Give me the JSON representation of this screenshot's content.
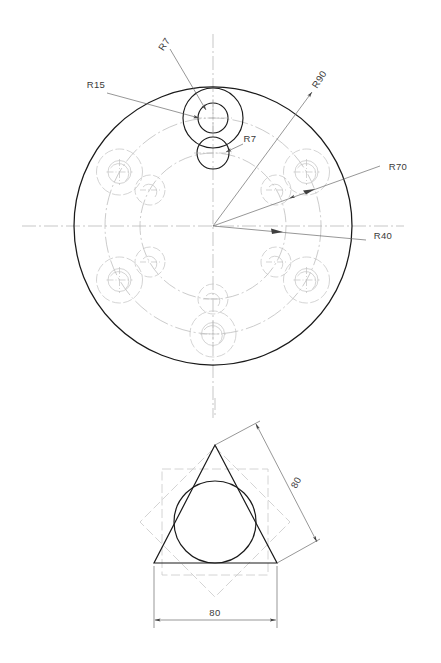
{
  "drawing": {
    "title": "Flange plate and triangle construction drawing",
    "sheet_background": "#ffffff",
    "line_color_object": "#1a1a1a",
    "line_color_center": "#a8a8a8",
    "line_color_hidden": "#b5b5b5",
    "line_color_dimension": "#555555",
    "text_color": "#3a3a3a"
  },
  "views": {
    "top_view": {
      "name": "Circular flange plate - plan view",
      "center": {
        "x": 213,
        "y": 226
      },
      "outer_circle": {
        "label": "R90",
        "radius_px": 139,
        "radius_value": 90,
        "style": "object"
      },
      "bolt_circle_outer": {
        "label": "R70",
        "radius_px": 108,
        "radius_value": 70,
        "style": "center"
      },
      "bolt_circle_inner": {
        "label": "R40",
        "radius_px": 73,
        "radius_value": 40,
        "style": "center"
      },
      "large_hole": {
        "label": "R15",
        "radius_px": 23,
        "radius_value": 15,
        "count": 6
      },
      "small_hole": {
        "label": "R7",
        "radius_px": 11,
        "radius_value": 7,
        "count": 6
      },
      "large_hole_bore": {
        "label": "R7",
        "radius_px": 11,
        "radius_value": 7
      },
      "dimensions": [
        {
          "id": "r15",
          "text": "R15",
          "x": 96,
          "y": 84,
          "rotate": 0,
          "target": "large-hole-outer"
        },
        {
          "id": "r7-top",
          "text": "R7",
          "x": 166,
          "y": 46,
          "rotate": -55,
          "target": "large-hole-bore"
        },
        {
          "id": "r7-inner",
          "text": "R7",
          "x": 242,
          "y": 139,
          "rotate": 0,
          "target": "small-hole"
        },
        {
          "id": "r90",
          "text": "R90",
          "x": 318,
          "y": 80,
          "rotate": -62,
          "target": "outer-circle"
        },
        {
          "id": "r70",
          "text": "R70",
          "x": 384,
          "y": 171,
          "rotate": 0,
          "target": "bolt-circle-outer"
        },
        {
          "id": "r40",
          "text": "R40",
          "x": 369,
          "y": 236,
          "rotate": 0,
          "target": "bolt-circle-inner"
        }
      ]
    },
    "bottom_view": {
      "name": "Triangle with inscribed circle and 8-point star construction",
      "triangle": {
        "apex": {
          "x": 215,
          "y": 445
        },
        "left": {
          "x": 154,
          "y": 563
        },
        "right": {
          "x": 277,
          "y": 563
        }
      },
      "inscribed_circle": {
        "center": {
          "x": 215,
          "y": 522
        },
        "radius_px": 41
      },
      "star": {
        "points": 8,
        "center": {
          "x": 215,
          "y": 522
        },
        "outer_radius_px": 75,
        "style": "hidden"
      },
      "dimensions": [
        {
          "id": "dim-base",
          "text": "80",
          "value": 80,
          "x": 215,
          "y": 616,
          "rotate": 0,
          "orientation": "horizontal"
        },
        {
          "id": "dim-slant",
          "text": "80",
          "value": 80,
          "x": 306,
          "y": 482,
          "rotate": -60,
          "orientation": "angled"
        }
      ]
    }
  },
  "labels": {
    "r15": "R15",
    "r7_top": "R7",
    "r7_inner": "R7",
    "r90": "R90",
    "r70": "R70",
    "r40": "R40",
    "dim_80_horizontal": "80",
    "dim_80_angled": "80"
  }
}
